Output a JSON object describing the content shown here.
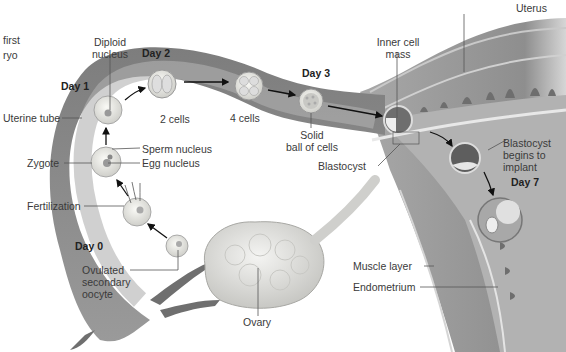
{
  "figure": {
    "type": "anatomical-diagram",
    "cropped_caption_fragments": [
      "first",
      "ryo"
    ],
    "palette": {
      "background": "#ffffff",
      "tube_outer": "#8a8a8a",
      "tube_lumen": "#a9a9a9",
      "uterus_wall": "#9c9c9c",
      "muscle_layer": "#8f8f8f",
      "endometrium": "#b5b5b5",
      "cell_fill": "#e8e8e4",
      "ovary": "#dcdcda",
      "text": "#3a3a3a",
      "leader_line": "#555555"
    }
  },
  "days": {
    "day0": "Day 0",
    "day1": "Day 1",
    "day2": "Day 2",
    "day3": "Day 3",
    "day7": "Day 7"
  },
  "labels": {
    "uterus": "Uterus",
    "diploid_nucleus": [
      "Diploid",
      "nucleus"
    ],
    "inner_cell_mass": [
      "Inner cell",
      "mass"
    ],
    "uterine_tube": "Uterine tube",
    "two_cells": "2 cells",
    "four_cells": "4 cells",
    "solid_ball": [
      "Solid",
      "ball of cells"
    ],
    "sperm_nucleus": "Sperm nucleus",
    "egg_nucleus": "Egg nucleus",
    "zygote": "Zygote",
    "blastocyst": "Blastocyst",
    "blastocyst_implant": [
      "Blastocyst",
      "begins to",
      "implant"
    ],
    "fertilization": "Fertilization",
    "ovulated_oocyte": [
      "Ovulated",
      "secondary",
      "oocyte"
    ],
    "muscle_layer": "Muscle layer",
    "endometrium": "Endometrium",
    "ovary": "Ovary"
  },
  "stages_sequence": [
    "Ovulated secondary oocyte",
    "Fertilization",
    "Zygote",
    "Diploid nucleus (Day 1)",
    "2 cells (Day 2)",
    "4 cells",
    "Solid ball of cells (Day 3)",
    "Blastocyst",
    "Blastocyst begins to implant",
    "Implanted (Day 7)"
  ]
}
